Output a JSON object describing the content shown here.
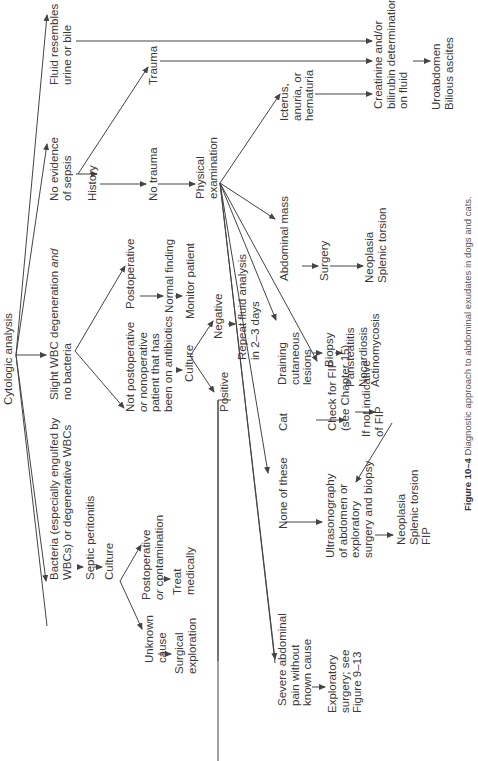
{
  "diagram": {
    "root": "Cytologic analysis",
    "branches": {
      "fluid_urine_bile": "Fluid resembles\nurine or bile",
      "no_sepsis": "No evidence\nof sepsis",
      "slight_wbc": "Slight WBC degeneration and\nno bacteria",
      "bacteria": "Bacteria (especially engulfed by\nWBCs) or degenerative WBCs",
      "severe_pain": "Severe abdominal\npain without\nknown cause"
    },
    "history": "History",
    "trauma": "Trauma",
    "no_trauma": "No trauma",
    "physical_exam": "Physical\nexamination",
    "icterus": "Icterus,\nanuria, or\nhematuria",
    "creatinine": "Creatinine and/or\nbilirubin determinations\non fluid",
    "uroabdomen": "Uroabdomen\nBilious ascites",
    "abdominal_mass": "Abdominal mass",
    "surgery": "Surgery",
    "neoplasia_splenic": "Neoplasia\nSplenic torsion",
    "draining": "Draining\ncutaneous\nlesions",
    "biopsy": "Biopsy",
    "pansteatitis": "Pansteatitis\nNocardiosis\nActinomycosis",
    "cat": "Cat",
    "check_fip": "Check for FIP\n(see Chapter 15)",
    "if_not_fip": "If not indicative\nof FIP",
    "none_of_these": "None of these",
    "ultrasonography": "Ultrasonography\nof abdomen or\nexploratory\nsurgery and biopsy",
    "neoplasia_fip": "Neoplasia\nSplenic torsion\nFIP",
    "postoperative": "Postoperative",
    "normal_finding": "Normal finding",
    "monitor_patient": "Monitor patient",
    "not_postoperative": "Not postoperative\nor nonoperative\npatient that has\nbeen on antibiotics",
    "culture_slight": "Culture",
    "negative": "Negative",
    "repeat_fluid": "Repeat fluid analysis\nin 2–3 days",
    "positive": "Positive",
    "septic_peritonitis": "Septic peritonitis",
    "culture_bacteria": "Culture",
    "postop_contamination": "Postoperative\nor contamination",
    "treat_medically": "Treat\nmedically",
    "unknown_cause": "Unknown\ncause",
    "surgical_exploration": "Surgical\nexploration",
    "exploratory_surgery": "Exploratory\nsurgery; see\nFigure 9–13"
  },
  "caption": {
    "label": "Figure 10–4",
    "text": "Diagnostic approach to abdominal exudates in dogs and cats."
  }
}
